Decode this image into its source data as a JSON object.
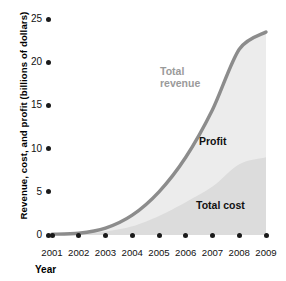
{
  "axes": {
    "y_title": "Revenue, cost, and profit (billions of dollars)",
    "x_title": "Year",
    "y_ticks": [
      "25",
      "20",
      "15",
      "10",
      "5",
      "0"
    ],
    "x_ticks": [
      "2001",
      "2002",
      "2003",
      "2004",
      "2005",
      "2006",
      "2007",
      "2008",
      "2009"
    ]
  },
  "labels": {
    "total_revenue": "Total\nrevenue",
    "profit": "Profit",
    "total_cost": "Total cost"
  },
  "colors": {
    "revenue_line": "#8c8c8c",
    "profit_fill": "#ececec",
    "cost_fill": "#dcdcdc",
    "tick": "#1a1a1a",
    "text": "#111111",
    "revenue_label": "#9a9a9a"
  },
  "chart_data": {
    "type": "area",
    "title": "",
    "xlabel": "Year",
    "ylabel": "Revenue, cost, and profit (billions of dollars)",
    "x": [
      2001,
      2002,
      2003,
      2004,
      2005,
      2006,
      2007,
      2008,
      2009
    ],
    "xlim": [
      2001,
      2009
    ],
    "ylim": [
      0,
      25
    ],
    "yticks": [
      0,
      5,
      10,
      15,
      20,
      25
    ],
    "grid": false,
    "legend": "inline-annotations",
    "stacked": true,
    "series": [
      {
        "name": "Total cost",
        "values": [
          0.1,
          0.15,
          0.4,
          1.0,
          2.2,
          3.8,
          5.6,
          8.2,
          9.0
        ],
        "fill": "#dcdcdc",
        "label_position": "inside-lower-right"
      },
      {
        "name": "Profit",
        "values": [
          0.0,
          0.05,
          0.4,
          1.3,
          2.8,
          5.2,
          8.9,
          13.3,
          14.5
        ],
        "fill": "#ececec",
        "label_position": "inside-middle-right",
        "note": "Profit = Total revenue - Total cost"
      },
      {
        "name": "Total revenue",
        "values": [
          0.1,
          0.2,
          0.8,
          2.3,
          5.0,
          9.0,
          14.5,
          21.5,
          23.5
        ],
        "stroke": "#8c8c8c",
        "type": "line",
        "label_position": "above-curve-left"
      }
    ]
  }
}
